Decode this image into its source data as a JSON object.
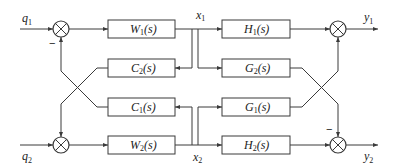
{
  "diagram": {
    "type": "block-diagram",
    "inputs": {
      "q1": {
        "base": "q",
        "sub": "1"
      },
      "q2": {
        "base": "q",
        "sub": "2"
      }
    },
    "outputs": {
      "y1": {
        "base": "y",
        "sub": "1"
      },
      "y2": {
        "base": "y",
        "sub": "2"
      }
    },
    "signals": {
      "x1": {
        "base": "x",
        "sub": "1"
      },
      "x2": {
        "base": "x",
        "sub": "2"
      }
    },
    "blocks": {
      "W1": {
        "base": "W",
        "sub": "1",
        "arg": "(s)"
      },
      "W2": {
        "base": "W",
        "sub": "2",
        "arg": "(s)"
      },
      "C1": {
        "base": "C",
        "sub": "1",
        "arg": "(s)"
      },
      "C2": {
        "base": "C",
        "sub": "2",
        "arg": "(s)"
      },
      "H1": {
        "base": "H",
        "sub": "1",
        "arg": "(s)"
      },
      "H2": {
        "base": "H",
        "sub": "2",
        "arg": "(s)"
      },
      "G1": {
        "base": "G",
        "sub": "1",
        "arg": "(s)"
      },
      "G2": {
        "base": "G",
        "sub": "2",
        "arg": "(s)"
      }
    },
    "signs": {
      "sum_in1_feedback": "−",
      "sum_out2_cross": "−"
    },
    "colors": {
      "line": "#3a3a3a",
      "text": "#222222",
      "background": "#ffffff"
    }
  }
}
